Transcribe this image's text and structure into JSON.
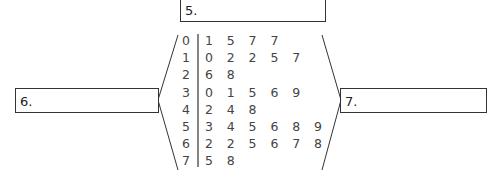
{
  "boxes": {
    "top": {
      "label": "5."
    },
    "left": {
      "label": "6."
    },
    "right": {
      "label": "7."
    }
  },
  "chart_data": {
    "type": "table",
    "rows": [
      {
        "stem": "0",
        "leaves": [
          "1",
          "5",
          "7",
          "7"
        ]
      },
      {
        "stem": "1",
        "leaves": [
          "0",
          "2",
          "2",
          "5",
          "7"
        ]
      },
      {
        "stem": "2",
        "leaves": [
          "6",
          "8"
        ]
      },
      {
        "stem": "3",
        "leaves": [
          "0",
          "1",
          "5",
          "6",
          "9"
        ]
      },
      {
        "stem": "4",
        "leaves": [
          "2",
          "4",
          "8"
        ]
      },
      {
        "stem": "5",
        "leaves": [
          "3",
          "4",
          "5",
          "6",
          "8",
          "9"
        ]
      },
      {
        "stem": "6",
        "leaves": [
          "2",
          "2",
          "5",
          "6",
          "7",
          "8"
        ]
      },
      {
        "stem": "7",
        "leaves": [
          "5",
          "8"
        ]
      }
    ]
  }
}
